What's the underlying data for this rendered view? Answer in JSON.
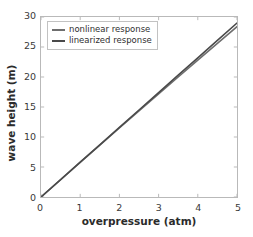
{
  "chart_data": {
    "type": "line",
    "title": "",
    "xlabel": "overpressure (atm)",
    "ylabel": "wave height (m)",
    "xlim": [
      0,
      5
    ],
    "ylim": [
      0,
      30
    ],
    "xticks": [
      0,
      1,
      2,
      3,
      4,
      5
    ],
    "yticks": [
      0,
      5,
      10,
      15,
      20,
      25,
      30
    ],
    "xtick_labels": [
      "0",
      "1",
      "2",
      "3",
      "4",
      "5"
    ],
    "ytick_labels": [
      "0",
      "5",
      "10",
      "15",
      "20",
      "25",
      "30"
    ],
    "grid": false,
    "legend_position": "upper left",
    "x": [
      0,
      0.5,
      1,
      1.5,
      2,
      2.5,
      3,
      3.5,
      4,
      4.5,
      5
    ],
    "series": [
      {
        "name": "nonlinear response",
        "color": "#6e6e6e",
        "values": [
          0,
          2.88,
          5.76,
          8.64,
          11.5,
          14.35,
          17.2,
          20.0,
          22.8,
          25.6,
          28.4
        ]
      },
      {
        "name": "linearized response",
        "color": "#4a4a4a",
        "values": [
          0,
          2.9,
          5.8,
          8.7,
          11.6,
          14.5,
          17.4,
          20.3,
          23.2,
          26.1,
          29.0
        ]
      }
    ]
  },
  "legend": {
    "entries": [
      {
        "label": "nonlinear response",
        "color": "#6e6e6e"
      },
      {
        "label": "linearized response",
        "color": "#4a4a4a"
      }
    ]
  },
  "colors": {
    "background": "#ffffff",
    "axis": "#b9b9b9",
    "tick_text": "#3a3a3a",
    "label_text": "#2b2b2b",
    "series_1": "#6e6e6e",
    "series_2": "#4a4a4a"
  }
}
